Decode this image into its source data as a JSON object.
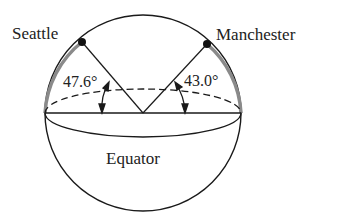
{
  "diagram": {
    "title": "",
    "labels": {
      "city_left": "Seattle",
      "city_right": "Manchester",
      "angle_left": "47.6°",
      "angle_right": "43.0°",
      "equator": "Equator"
    },
    "colors": {
      "line": "#1a1a1a",
      "latitude_arc": "#8a8a8a",
      "text": "#222222"
    }
  }
}
